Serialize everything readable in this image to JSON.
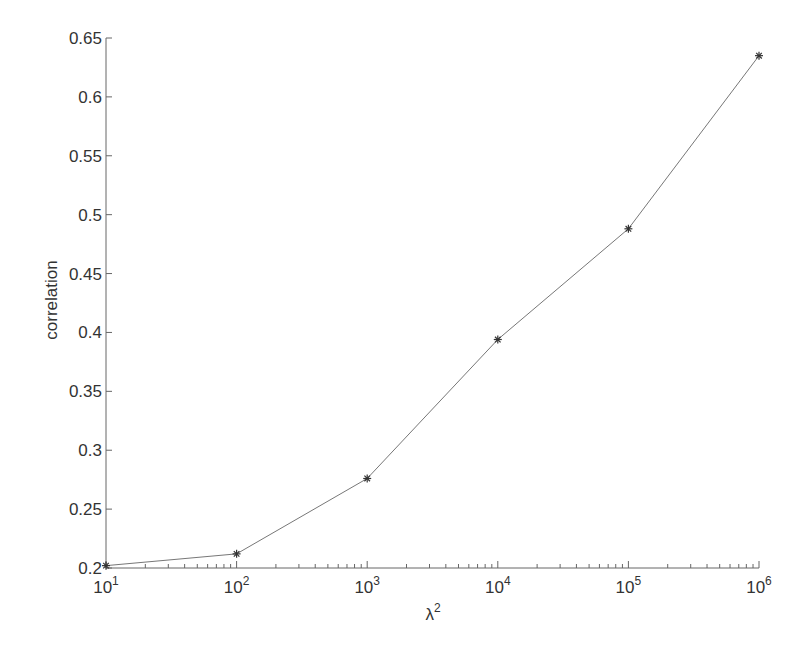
{
  "chart_data": {
    "type": "line",
    "title": "",
    "xlabel": "λ²",
    "ylabel": "correlation",
    "xscale": "log",
    "x": [
      10,
      100,
      1000,
      10000,
      100000,
      1000000
    ],
    "x_exponents": [
      1,
      2,
      3,
      4,
      5,
      6
    ],
    "series": [
      {
        "name": "correlation",
        "marker": "*",
        "color": "#555555",
        "values": [
          0.202,
          0.212,
          0.276,
          0.394,
          0.488,
          0.635
        ]
      }
    ],
    "xlim": [
      10,
      1000000
    ],
    "ylim": [
      0.2,
      0.65
    ],
    "xticks": [
      {
        "base": "10",
        "exp": "1"
      },
      {
        "base": "10",
        "exp": "2"
      },
      {
        "base": "10",
        "exp": "3"
      },
      {
        "base": "10",
        "exp": "4"
      },
      {
        "base": "10",
        "exp": "5"
      },
      {
        "base": "10",
        "exp": "6"
      }
    ],
    "yticks": [
      "0.2",
      "0.25",
      "0.3",
      "0.35",
      "0.4",
      "0.45",
      "0.5",
      "0.55",
      "0.6",
      "0.65"
    ],
    "grid": false,
    "legend": null
  },
  "colors": {
    "axis": "#666666",
    "line": "#777777",
    "marker": "#333333",
    "text": "#333333"
  }
}
